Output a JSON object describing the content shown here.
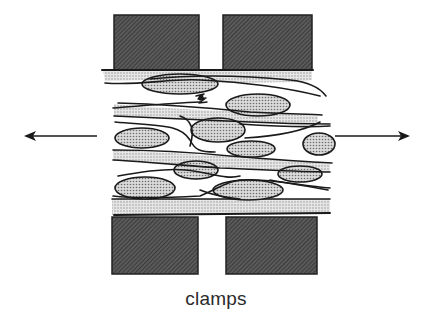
{
  "diagram": {
    "type": "schematic",
    "caption": "clamps",
    "elements": {
      "clamps": [
        {
          "id": "top-left",
          "position": "top"
        },
        {
          "id": "top-right",
          "position": "top"
        },
        {
          "id": "bottom-left",
          "position": "bottom"
        },
        {
          "id": "bottom-right",
          "position": "bottom"
        }
      ],
      "arrows": [
        {
          "id": "left",
          "direction": "left"
        },
        {
          "id": "right",
          "direction": "right"
        }
      ]
    },
    "colors": {
      "clamp_fill": "#4a4a4a",
      "fiber_band": "#d4d4d4",
      "cell_fill": "#c8c8c8",
      "outline": "#1a1a1a",
      "arrow": "#1a1a1a",
      "background": "#ffffff"
    }
  }
}
